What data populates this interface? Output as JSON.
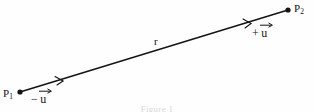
{
  "figure": {
    "caption": "Figure 1",
    "background_color": "#fefefe",
    "stroke_color": "#141414"
  },
  "points": [
    {
      "id": "p1",
      "name": "P",
      "subscript": "1",
      "x": 20,
      "y": 92
    },
    {
      "id": "p2",
      "name": "P",
      "subscript": "2",
      "x": 288,
      "y": 10
    }
  ],
  "segment": {
    "label": "r",
    "from": "p1",
    "to": "p2",
    "x1": 20,
    "y1": 92,
    "x2": 288,
    "y2": 10
  },
  "vectors": [
    {
      "id": "minus-u",
      "sign": "−",
      "symbol": "u",
      "near_point": "p1",
      "direction": "toward-p2"
    },
    {
      "id": "plus-u",
      "sign": "+",
      "symbol": "u",
      "near_point": "p2",
      "direction": "toward-p2"
    }
  ],
  "ticks": [
    {
      "id": "tick-lower",
      "x": 60,
      "y": 80
    },
    {
      "id": "tick-upper",
      "x": 248,
      "y": 23
    }
  ]
}
